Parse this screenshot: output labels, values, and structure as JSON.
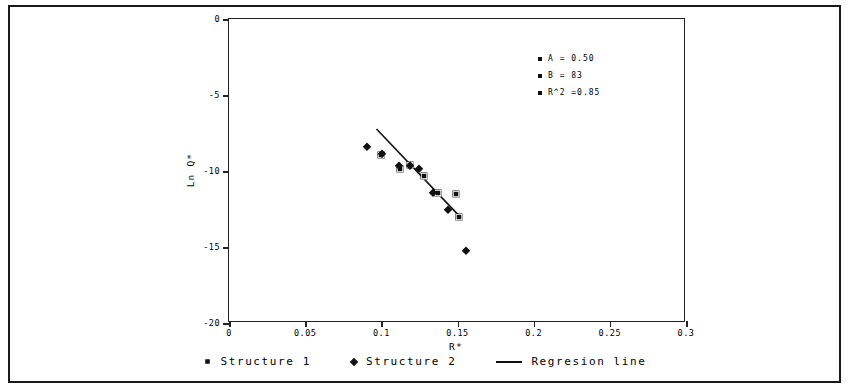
{
  "chart_data": {
    "type": "scatter",
    "title": "",
    "xlabel": "R*",
    "ylabel": "Ln Q*",
    "xlim": [
      0,
      0.3
    ],
    "ylim": [
      -20,
      0
    ],
    "xticks": [
      "0",
      "0.05",
      "0.1",
      "0.15",
      "0.2",
      "0.25",
      "0.3"
    ],
    "xtick_values": [
      0,
      0.05,
      0.1,
      0.15,
      0.2,
      0.25,
      0.3
    ],
    "yticks": [
      "0",
      "-5",
      "-10",
      "-15",
      "-20"
    ],
    "ytick_values": [
      0,
      -5,
      -10,
      -15,
      -20
    ],
    "grid": false,
    "legend_position": "below-plot",
    "series": [
      {
        "name": "Structure 1",
        "marker": "square",
        "color": "#111111",
        "points": [
          {
            "x": 0.1,
            "y": -8.95
          },
          {
            "x": 0.112,
            "y": -9.85
          },
          {
            "x": 0.119,
            "y": -9.6
          },
          {
            "x": 0.128,
            "y": -10.3
          },
          {
            "x": 0.137,
            "y": -11.45
          },
          {
            "x": 0.149,
            "y": -11.5
          },
          {
            "x": 0.151,
            "y": -13.0
          }
        ]
      },
      {
        "name": "Structure 2",
        "marker": "diamond",
        "color": "#111111",
        "points": [
          {
            "x": 0.0905,
            "y": -8.45
          },
          {
            "x": 0.1005,
            "y": -8.9
          },
          {
            "x": 0.1115,
            "y": -9.7
          },
          {
            "x": 0.1185,
            "y": -9.65
          },
          {
            "x": 0.1245,
            "y": -9.9
          },
          {
            "x": 0.134,
            "y": -11.45
          },
          {
            "x": 0.1435,
            "y": -12.55
          },
          {
            "x": 0.1555,
            "y": -15.25
          }
        ]
      }
    ],
    "regression_line": {
      "name": "Regresion line",
      "color": "#111111",
      "x0": 0.0975,
      "y0": -7.3,
      "x1": 0.153,
      "y1": -13.15
    },
    "annotations": [
      {
        "marker": "square",
        "text": "A = 0.50"
      },
      {
        "marker": "square",
        "text": "B = 83"
      },
      {
        "marker": "square",
        "text": "R^2 =0.85"
      }
    ]
  },
  "legend": {
    "items": [
      {
        "label": "Structure 1",
        "marker": "square"
      },
      {
        "label": "Structure 2",
        "marker": "diamond"
      },
      {
        "label": "Regresion line",
        "marker": "line"
      }
    ]
  }
}
